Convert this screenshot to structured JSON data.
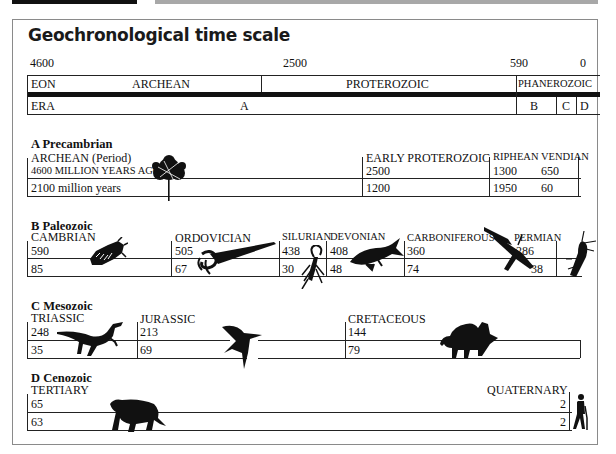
{
  "title": "Geochronological time scale",
  "scale": {
    "ticks": [
      "4600",
      "2500",
      "590",
      "0"
    ],
    "eon_label": "EON",
    "eons": [
      "ARCHEAN",
      "PROTEROZOIC",
      "PHANEROZOIC"
    ],
    "era_label": "ERA",
    "eras": [
      "A",
      "B",
      "C",
      "D"
    ]
  },
  "sections": {
    "precambrian": {
      "heading": "A  Precambrian",
      "period": "ARCHEAN (Period)",
      "start": "4600 MILLION YEARS AGO",
      "duration": "2100 million years",
      "sub": [
        {
          "name": "EARLY PROTEROZOIC",
          "start": "2500",
          "duration": "1200"
        },
        {
          "name": "RIPHEAN",
          "start": "1300",
          "duration": "1950"
        },
        {
          "name": "VENDIAN",
          "start": "650",
          "duration": "60"
        }
      ]
    },
    "paleozoic": {
      "heading": "B  Paleozoic",
      "periods": [
        {
          "name": "CAMBRIAN",
          "start": "590",
          "duration": "85"
        },
        {
          "name": "ORDOVICIAN",
          "start": "505",
          "duration": "67"
        },
        {
          "name": "SILURIAN",
          "start": "438",
          "duration": "30"
        },
        {
          "name": "DEVONIAN",
          "start": "408",
          "duration": "48"
        },
        {
          "name": "CARBONIFEROUS",
          "start": "360",
          "duration": "74"
        },
        {
          "name": "PERMIAN",
          "start": "286",
          "duration": "38"
        }
      ]
    },
    "mesozoic": {
      "heading": "C  Mesozoic",
      "periods": [
        {
          "name": "TRIASSIC",
          "start": "248",
          "duration": "35"
        },
        {
          "name": "JURASSIC",
          "start": "213",
          "duration": "69"
        },
        {
          "name": "CRETACEOUS",
          "start": "144",
          "duration": "79"
        }
      ]
    },
    "cenozoic": {
      "heading": "D  Cenozoic",
      "periods": [
        {
          "name": "TERTIARY",
          "start": "65",
          "duration": "63"
        },
        {
          "name": "QUATERNARY",
          "start": "2",
          "duration": "2"
        }
      ]
    }
  },
  "icons": [
    "stromatolite-tree-icon",
    "trilobite-icon",
    "nautiloid-icon",
    "scorpion-icon",
    "lobe-fin-fish-icon",
    "dragonfly-icon",
    "beetle-icon",
    "dinosaur-icon",
    "pterosaur-icon",
    "triceratops-icon",
    "sabertooth-cat-icon",
    "human-icon"
  ]
}
